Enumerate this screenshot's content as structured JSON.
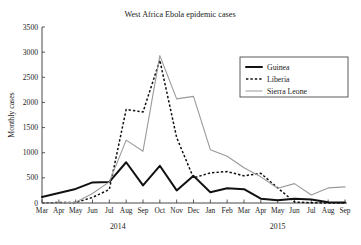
{
  "chart_data": {
    "type": "line",
    "title": "West Africa Ebola epidemic cases",
    "xlabel": "",
    "ylabel": "Monthly cases",
    "ylim": [
      0,
      3500
    ],
    "yticks": [
      0,
      500,
      1000,
      1500,
      2000,
      2500,
      3000,
      3500
    ],
    "grid": false,
    "legend_position": "top-right",
    "categories": [
      "Mar",
      "Apr",
      "May",
      "Jun",
      "Jul",
      "Aug",
      "Sep",
      "Oct",
      "Nov",
      "Dec",
      "Jan",
      "Feb",
      "Mar",
      "Apr",
      "May",
      "Jun",
      "Jul",
      "Aug",
      "Sep"
    ],
    "group_labels": [
      {
        "label": "2014",
        "start_index": 0,
        "end_index": 9
      },
      {
        "label": "2015",
        "start_index": 10,
        "end_index": 18
      }
    ],
    "series": [
      {
        "name": "Guinea",
        "color": "#111111",
        "style": "solid-thick",
        "values": [
          120,
          200,
          280,
          410,
          420,
          810,
          350,
          740,
          250,
          540,
          215,
          295,
          275,
          85,
          55,
          85,
          70,
          15,
          10
        ]
      },
      {
        "name": "Liberia",
        "color": "#111111",
        "style": "dotted",
        "values": [
          0,
          10,
          10,
          110,
          270,
          1860,
          1810,
          2840,
          1300,
          500,
          600,
          625,
          540,
          590,
          300,
          20,
          5,
          0,
          0
        ]
      },
      {
        "name": "Sierra Leone",
        "color": "#9a9a9a",
        "style": "solid-thin",
        "values": [
          0,
          0,
          15,
          190,
          420,
          1250,
          1030,
          2930,
          2070,
          2120,
          1060,
          930,
          700,
          520,
          295,
          385,
          160,
          300,
          320
        ]
      }
    ]
  },
  "legend": {
    "items": [
      {
        "label": "Guinea"
      },
      {
        "label": "Liberia"
      },
      {
        "label": "Sierra Leone"
      }
    ]
  }
}
